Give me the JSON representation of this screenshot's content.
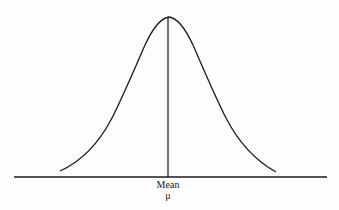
{
  "diagram": {
    "type": "normal-distribution-curve",
    "mean_label": "Mean",
    "mean_symbol": "μ",
    "colors": {
      "line": "#1a1a1a",
      "background": "#fdfdfd"
    }
  }
}
